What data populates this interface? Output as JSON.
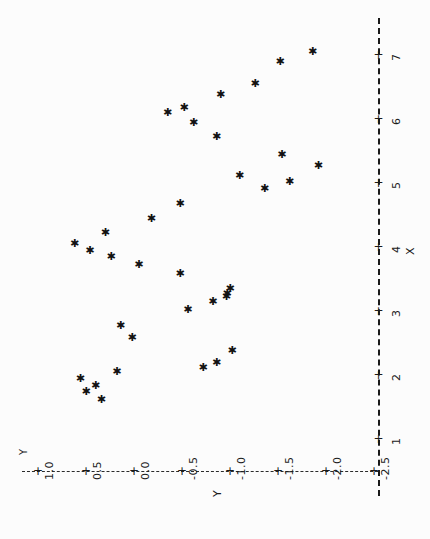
{
  "chart_data": {
    "type": "scatter",
    "title": "",
    "xlabel": "X",
    "ylabel": "Y",
    "orientation": "rotated-90ccw",
    "grid": false,
    "legend": null,
    "marker": "asterisk",
    "marker_color": "#121212",
    "background_color": "#fcfcfc",
    "axis_color": "#1a1a1a",
    "axis_style": "dashed",
    "xlim": [
      0.6,
      7.4
    ],
    "ylim": [
      -2.7,
      1.2
    ],
    "xticks": [
      1,
      2,
      3,
      4,
      5,
      6,
      7
    ],
    "xtick_labels": [
      "1",
      "2",
      "3",
      "4",
      "5",
      "6",
      "7"
    ],
    "yticks": [
      1.0,
      0.5,
      0.0,
      -0.5,
      -1.0,
      -1.5,
      -2.0,
      -2.5
    ],
    "ytick_labels": [
      "1.0",
      "0.5",
      "0.0",
      "-0.5",
      "-1.0",
      "-1.5",
      "-2.0",
      "-2.5"
    ],
    "points": [
      {
        "x": 1.62,
        "y": 0.34
      },
      {
        "x": 1.75,
        "y": 0.5
      },
      {
        "x": 1.83,
        "y": 0.4
      },
      {
        "x": 1.95,
        "y": 0.56
      },
      {
        "x": 2.05,
        "y": 0.18
      },
      {
        "x": 2.12,
        "y": -0.72
      },
      {
        "x": 2.2,
        "y": -0.86
      },
      {
        "x": 2.38,
        "y": -1.02
      },
      {
        "x": 2.58,
        "y": 0.02
      },
      {
        "x": 2.78,
        "y": 0.14
      },
      {
        "x": 3.02,
        "y": -0.56
      },
      {
        "x": 3.15,
        "y": -0.82
      },
      {
        "x": 3.22,
        "y": -0.96
      },
      {
        "x": 3.28,
        "y": -0.97
      },
      {
        "x": 3.35,
        "y": -1.0
      },
      {
        "x": 3.58,
        "y": -0.48
      },
      {
        "x": 3.72,
        "y": -0.05
      },
      {
        "x": 3.85,
        "y": 0.24
      },
      {
        "x": 3.95,
        "y": 0.46
      },
      {
        "x": 4.05,
        "y": 0.62
      },
      {
        "x": 4.22,
        "y": 0.3
      },
      {
        "x": 4.45,
        "y": -0.18
      },
      {
        "x": 4.68,
        "y": -0.48
      },
      {
        "x": 4.92,
        "y": -1.36
      },
      {
        "x": 5.02,
        "y": -1.62
      },
      {
        "x": 5.12,
        "y": -1.1
      },
      {
        "x": 5.28,
        "y": -1.92
      },
      {
        "x": 5.45,
        "y": -1.54
      },
      {
        "x": 5.72,
        "y": -0.86
      },
      {
        "x": 5.95,
        "y": -0.62
      },
      {
        "x": 6.1,
        "y": -0.35
      },
      {
        "x": 6.18,
        "y": -0.52
      },
      {
        "x": 6.38,
        "y": -0.9
      },
      {
        "x": 6.55,
        "y": -1.26
      },
      {
        "x": 6.9,
        "y": -1.52
      },
      {
        "x": 7.05,
        "y": -1.86
      }
    ]
  }
}
